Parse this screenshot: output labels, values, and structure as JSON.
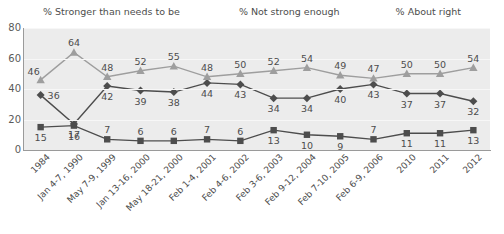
{
  "chart_data": {
    "type": "line",
    "title": "",
    "xlabel": "",
    "ylabel": "",
    "ylim": [
      0,
      80
    ],
    "yticks": [
      0,
      20,
      40,
      60,
      80
    ],
    "grid": true,
    "legend_position": "top",
    "categories": [
      "1984",
      "Jan 4-7, 1990",
      "May 7-9, 1999",
      "Jan 13-16, 2000",
      "May 18-21, 2000",
      "Feb 1-4, 2001",
      "Feb 4-6, 2002",
      "Feb 3-6, 2003",
      "Feb 9-12, 2004",
      "Feb 7-10, 2005",
      "Feb 6-9, 2006",
      "2010",
      "2011",
      "2012"
    ],
    "series": [
      {
        "name": "% Stronger than needs to be",
        "marker": "square",
        "color": "#4d4d4d",
        "values": [
          15,
          16,
          7,
          6,
          6,
          7,
          6,
          13,
          10,
          9,
          7,
          11,
          11,
          13
        ]
      },
      {
        "name": "% Not strong enough",
        "marker": "diamond",
        "color": "#4d4d4d",
        "values": [
          36,
          17,
          42,
          39,
          38,
          44,
          43,
          34,
          34,
          40,
          43,
          37,
          37,
          32
        ]
      },
      {
        "name": "% About right",
        "marker": "triangle",
        "color": "#9e9e9e",
        "values": [
          46,
          64,
          48,
          52,
          55,
          48,
          50,
          52,
          54,
          49,
          47,
          50,
          50,
          54
        ]
      }
    ],
    "label_offsets": {
      "% Stronger than needs to be": [
        "below",
        "below",
        "above",
        "above",
        "above",
        "above",
        "above",
        "below",
        "below",
        "below",
        "above",
        "below",
        "below",
        "below"
      ],
      "% Not strong enough": [
        "right",
        "below",
        "below",
        "below",
        "below",
        "below",
        "below",
        "below",
        "below",
        "below",
        "below",
        "below",
        "below",
        "below"
      ],
      "% About right": [
        "left",
        "above",
        "above",
        "above",
        "above",
        "above",
        "above",
        "above",
        "above",
        "above",
        "above",
        "above",
        "above",
        "above"
      ]
    }
  },
  "colors": {
    "plot_background": "#ececec",
    "gridline": "#f7f7f7",
    "axis": "#9a9a9a",
    "text": "#4d4d4d"
  }
}
